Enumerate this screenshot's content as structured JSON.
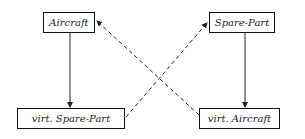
{
  "nodes": [
    {
      "id": "aircraft",
      "label": "Aircraft"
    },
    {
      "id": "spare_part",
      "label": "Spare-Part"
    },
    {
      "id": "virt_spare_part",
      "label": "virt. Spare-Part"
    },
    {
      "id": "virt_aircraft",
      "label": "virt. Aircraft"
    }
  ],
  "edges": [
    {
      "from": "aircraft",
      "to": "virt_spare_part",
      "style": "solid"
    },
    {
      "from": "spare_part",
      "to": "virt_aircraft",
      "style": "solid"
    },
    {
      "from": "virt_spare_part",
      "to": "spare_part",
      "style": "dashed"
    },
    {
      "from": "virt_aircraft",
      "to": "aircraft",
      "style": "dashed"
    }
  ],
  "colors": {
    "line": "#222222",
    "background": "#ffffff"
  }
}
